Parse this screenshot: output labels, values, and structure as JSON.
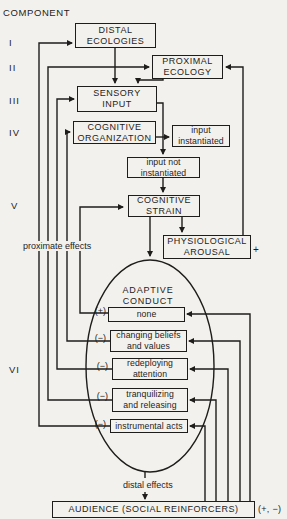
{
  "cropped_title": "COGNITIVE STRAIN MODEL",
  "header": {
    "component_label": "COMPONENT"
  },
  "components": [
    {
      "numeral": "I"
    },
    {
      "numeral": "II"
    },
    {
      "numeral": "III"
    },
    {
      "numeral": "IV"
    },
    {
      "numeral": "V"
    },
    {
      "numeral": "VI"
    }
  ],
  "nodes": {
    "distal_ecologies": {
      "label": "DISTAL\nECOLOGIES"
    },
    "proximal_ecology": {
      "label": "PROXIMAL\nECOLOGY"
    },
    "sensory_input": {
      "label": "SENSORY\nINPUT"
    },
    "cognitive_organization": {
      "label": "COGNITIVE\nORGANIZATION"
    },
    "input_instantiated": {
      "label": "input\ninstantiated"
    },
    "input_not_instantiated": {
      "label": "input not\ninstantiated"
    },
    "cognitive_strain": {
      "label": "COGNITIVE\nSTRAIN"
    },
    "physiological_arousal": {
      "label": "PHYSIOLOGICAL\nAROUSAL",
      "annotation": "+"
    },
    "audience": {
      "label": "AUDIENCE (SOCIAL REINFORCERS)",
      "annotation": "(+, −)"
    }
  },
  "adaptive_conduct": {
    "title": "ADAPTIVE\nCONDUCT",
    "items": [
      {
        "sign": "(+)",
        "label": "none"
      },
      {
        "sign": "(−)",
        "label": "changing beliefs\nand values"
      },
      {
        "sign": "(−)",
        "label": "redeploying\nattention"
      },
      {
        "sign": "(−)",
        "label": "tranquilizing\nand releasing"
      },
      {
        "sign": "(−)",
        "label": "instrumental acts"
      }
    ]
  },
  "annotations": {
    "proximate_effects": "proximate effects",
    "distal_effects": "distal effects"
  },
  "colors": {
    "ink": "#1e1d1b",
    "paper": "#f3f1ed"
  },
  "edges": [
    {
      "from": "distal_ecologies",
      "to": "sensory_input"
    },
    {
      "from": "proximal_ecology",
      "to": "sensory_input"
    },
    {
      "from": "sensory_input",
      "to": "input_not_instantiated"
    },
    {
      "from": "cognitive_organization",
      "to": "input_instantiated"
    },
    {
      "from": "cognitive_organization",
      "to": "input_not_instantiated"
    },
    {
      "from": "input_not_instantiated",
      "to": "cognitive_strain"
    },
    {
      "from": "cognitive_strain",
      "to": "adaptive_conduct"
    },
    {
      "from": "cognitive_strain",
      "to": "physiological_arousal"
    },
    {
      "from": "physiological_arousal",
      "to": "proximal_ecology"
    },
    {
      "from": "none",
      "to": "cognitive_strain",
      "type": "proximate effect"
    },
    {
      "from": "changing_beliefs_and_values",
      "to": "cognitive_organization",
      "type": "proximate effect"
    },
    {
      "from": "redeploying_attention",
      "to": "sensory_input",
      "type": "proximate effect"
    },
    {
      "from": "tranquilizing_and_releasing",
      "to": "proximal_ecology",
      "type": "proximate effect"
    },
    {
      "from": "instrumental_acts",
      "to": "distal_ecologies",
      "type": "proximate effect"
    },
    {
      "from": "adaptive_conduct",
      "to": "audience",
      "type": "distal effect"
    },
    {
      "from": "audience",
      "to": "none"
    },
    {
      "from": "audience",
      "to": "changing_beliefs_and_values"
    },
    {
      "from": "audience",
      "to": "redeploying_attention"
    },
    {
      "from": "audience",
      "to": "tranquilizing_and_releasing"
    },
    {
      "from": "audience",
      "to": "instrumental_acts"
    }
  ]
}
